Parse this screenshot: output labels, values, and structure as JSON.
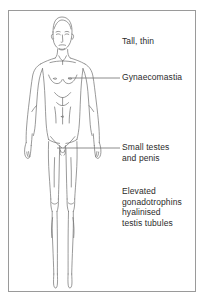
{
  "panel": {
    "border_color": "#9a9a9a",
    "background_color": "#ffffff"
  },
  "illustration": {
    "name": "anterior full-body line drawing of a tall thin male figure",
    "line_color": "#6e6e6e"
  },
  "annotations": [
    {
      "id": "tall-thin",
      "text": "Tall, thin",
      "has_leader_line": false
    },
    {
      "id": "gynaecomastia",
      "text": "Gynaecomastia",
      "has_leader_line": true
    },
    {
      "id": "small-testes",
      "text": "Small testes\nand penis",
      "has_leader_line": true
    },
    {
      "id": "elevated-gonadotrophins",
      "text": "Elevated\ngonadotrophins\nhyalinised\ntestis tubules",
      "has_leader_line": false
    }
  ],
  "leader_lines": {
    "gynaecomastia": {
      "x1": 68,
      "y1": 78,
      "x2": 120,
      "y2": 78
    },
    "small_testes": {
      "x1": 57,
      "y1": 148,
      "x2": 120,
      "y2": 148
    }
  },
  "text_color": "#2b2b2b"
}
